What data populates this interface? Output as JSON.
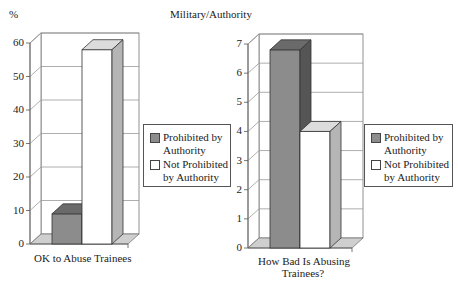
{
  "header": {
    "percent_label": "%",
    "title": "Military/Authority"
  },
  "colors": {
    "prohibited": "#8c8c8c",
    "prohibited_side": "#555555",
    "prohibited_top": "#6a6a6a",
    "not_prohibited": "#ffffff",
    "not_prohibited_side": "#b5b5b5",
    "not_prohibited_top": "#dcdcdc",
    "floor": "#cfcfcf",
    "grid": "#999999"
  },
  "legend": {
    "items": [
      {
        "line1": "Prohibited by",
        "line2": "Authority"
      },
      {
        "line1": "Not Prohibited",
        "line2": "by Authority"
      }
    ]
  },
  "chart_data": [
    {
      "type": "bar",
      "title": "",
      "xlabel": "OK to Abuse Trainees",
      "ylabel": "%",
      "categories": [
        "OK to Abuse Trainees"
      ],
      "series": [
        {
          "name": "Prohibited by Authority",
          "values": [
            9
          ]
        },
        {
          "name": "Not Prohibited by Authority",
          "values": [
            58
          ]
        }
      ],
      "ylim": [
        0,
        60
      ],
      "yticks": [
        "0",
        "10",
        "20",
        "30",
        "40",
        "50",
        "60"
      ],
      "grid": true,
      "legend_position": "right",
      "style": "3d"
    },
    {
      "type": "bar",
      "title": "",
      "xlabel": "How Bad Is Abusing Trainees?",
      "xlabel_lines": [
        "How Bad Is Abusing",
        "Trainees?"
      ],
      "ylabel": "",
      "categories": [
        "How Bad Is Abusing Trainees?"
      ],
      "series": [
        {
          "name": "Prohibited by Authority",
          "values": [
            6.8
          ]
        },
        {
          "name": "Not Prohibited by Authority",
          "values": [
            4.0
          ]
        }
      ],
      "ylim": [
        0,
        7
      ],
      "yticks": [
        "0",
        "1",
        "2",
        "3",
        "4",
        "5",
        "6",
        "7"
      ],
      "grid": true,
      "legend_position": "right",
      "style": "3d"
    }
  ]
}
